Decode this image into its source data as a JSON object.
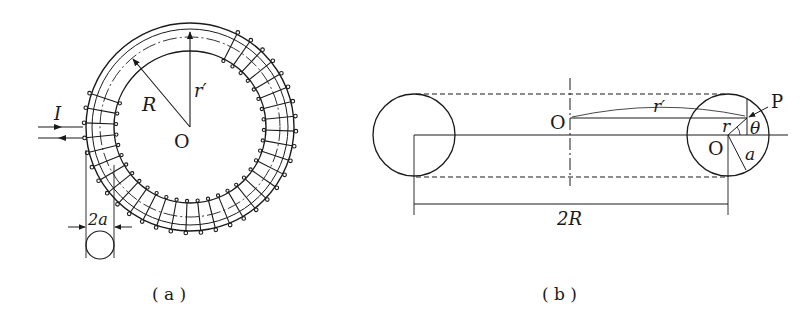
{
  "figure_a": {
    "caption": "( a )",
    "labels": {
      "current": "I",
      "major_radius": "R",
      "radius_prime": "r′",
      "center": "O",
      "diameter": "2a"
    }
  },
  "figure_b": {
    "caption": "( b )",
    "labels": {
      "center_main": "O",
      "radius_prime": "r′",
      "point": "P",
      "small_r": "r",
      "angle": "θ",
      "center_tube": "O",
      "tube_radius": "a",
      "span": "2R"
    }
  },
  "colors": {
    "ink": "#1a1a1a",
    "background": "#ffffff"
  }
}
